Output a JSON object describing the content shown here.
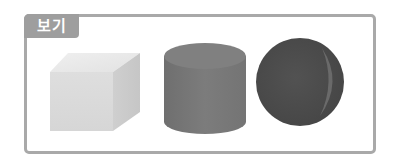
{
  "box": {
    "label": "보기"
  },
  "shapes": [
    {
      "name": "cube",
      "color": "#dcdcdc"
    },
    {
      "name": "cylinder",
      "color": "#7a7a7a"
    },
    {
      "name": "sphere",
      "color": "#4d4d4d"
    }
  ],
  "colors": {
    "frame": "#a9a9a9",
    "label_bg": "#9e9e9e",
    "label_text": "#ffffff"
  }
}
